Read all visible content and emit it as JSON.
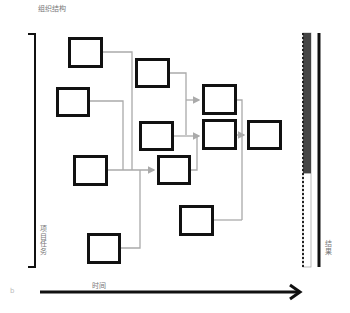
{
  "title": "组织结构",
  "left_axis_label": "项目任务",
  "right_axis_label": "结果",
  "bottom_axis_label": "时间",
  "corner_label": "b",
  "colors": {
    "box_border": "#111111",
    "connector": "#aaaaaa",
    "progress_fill": "#444444",
    "axis": "#111111"
  },
  "progress": {
    "filled_fraction": 0.6
  },
  "boxes": [
    "A",
    "B",
    "C",
    "D",
    "E",
    "F",
    "G",
    "H",
    "I",
    "J",
    "K"
  ]
}
